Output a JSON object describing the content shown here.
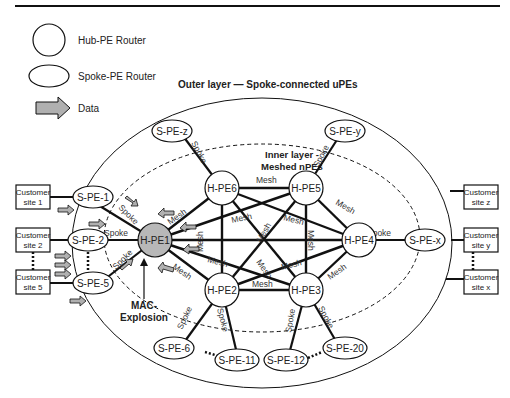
{
  "legend": {
    "hub": "Hub-PE Router",
    "spoke": "Spoke-PE Router",
    "data": "Data"
  },
  "titles": {
    "outer": "Outer layer — Spoke-connected uPEs",
    "inner_line1": "Inner layer -",
    "inner_line2": "Meshed nPEs",
    "mac_line1": "MAC-",
    "mac_line2": "Explosion"
  },
  "hubs": {
    "h1": "H-PE1",
    "h2": "H-PE2",
    "h3": "H-PE3",
    "h4": "H-PE4",
    "h5": "H-PE5",
    "h6": "H-PE6"
  },
  "spokes": {
    "s1": "S-PE-1",
    "s2": "S-PE-2",
    "s5": "S-PE-5",
    "s6": "S-PE-6",
    "s11": "S-PE-11",
    "s12": "S-PE-12",
    "s20": "S-PE-20",
    "sx": "S-PE-x",
    "sy": "S-PE-y",
    "sz": "S-PE-z"
  },
  "sites": {
    "site1": [
      "Customer",
      "site 1"
    ],
    "site2": [
      "Customer",
      "site 2"
    ],
    "site5": [
      "Customer",
      "site 5"
    ],
    "sitez": [
      "Customer",
      "site z"
    ],
    "sitey": [
      "Customer",
      "site y"
    ],
    "sitex": [
      "Customer",
      "site x"
    ]
  },
  "links": {
    "mesh": "Mesh",
    "spoke": "Spoke"
  },
  "colors": {
    "hub_highlight": "#b8b8b8",
    "arrow_fill": "#b0b0b0",
    "line": "#111111"
  }
}
